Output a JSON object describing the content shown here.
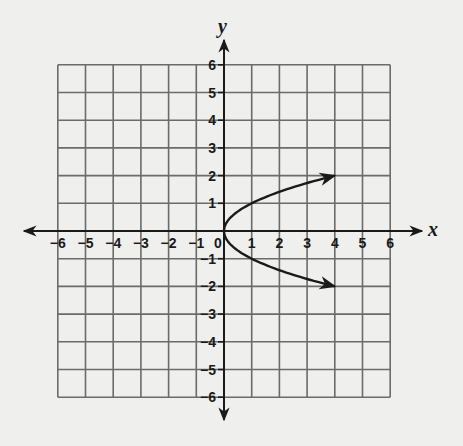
{
  "chart_data": {
    "type": "line",
    "title": "",
    "xlabel": "x",
    "ylabel": "y",
    "xlim": [
      -6,
      6
    ],
    "ylim": [
      -6,
      6
    ],
    "grid": true,
    "x_ticks": [
      -6,
      -5,
      -4,
      -3,
      -2,
      -1,
      0,
      1,
      2,
      3,
      4,
      5,
      6
    ],
    "y_ticks": [
      6,
      5,
      4,
      3,
      2,
      1,
      -1,
      -2,
      -3,
      -4,
      -5,
      -6
    ],
    "x_tick_labels": [
      "−6",
      "−5",
      "−4",
      "−3",
      "−2",
      "−1",
      "0",
      "1",
      "2",
      "3",
      "4",
      "5",
      "6"
    ],
    "y_tick_labels": [
      "6",
      "5",
      "4",
      "3",
      "2",
      "1",
      "−1",
      "−2",
      "−3",
      "−4",
      "−5",
      "−6"
    ],
    "series": [
      {
        "name": "x = y^2",
        "equation": "x = y^2",
        "x": [
          4,
          2.25,
          1,
          0.25,
          0,
          0.25,
          1,
          2.25,
          4
        ],
        "y": [
          2,
          1.5,
          1,
          0.5,
          0,
          -0.5,
          -1,
          -1.5,
          -2
        ],
        "arrows_at_ends": true
      }
    ],
    "legend": null
  },
  "colors": {
    "background": "#efefed",
    "grid": "#6b6b6b",
    "axis": "#1a1a1a",
    "curve": "#1a1a1a"
  }
}
